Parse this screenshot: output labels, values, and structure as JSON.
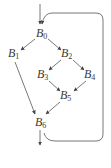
{
  "diagram": {
    "type": "control-flow-graph",
    "stroke_color": "#555555",
    "text_color": "#3a3a3a",
    "nodes": [
      {
        "id": "B0",
        "letter": "B",
        "index": "0",
        "x": 36,
        "y": 27
      },
      {
        "id": "B1",
        "letter": "B",
        "index": "1",
        "x": 8,
        "y": 47
      },
      {
        "id": "B2",
        "letter": "B",
        "index": "2",
        "x": 61,
        "y": 47
      },
      {
        "id": "B3",
        "letter": "B",
        "index": "3",
        "x": 37,
        "y": 68
      },
      {
        "id": "B4",
        "letter": "B",
        "index": "4",
        "x": 84,
        "y": 68
      },
      {
        "id": "B5",
        "letter": "B",
        "index": "5",
        "x": 60,
        "y": 89
      },
      {
        "id": "B6",
        "letter": "B",
        "index": "6",
        "x": 35,
        "y": 116
      }
    ],
    "edges": [
      {
        "from": "entry",
        "to": "B0"
      },
      {
        "from": "B0",
        "to": "B1"
      },
      {
        "from": "B0",
        "to": "B2"
      },
      {
        "from": "B1",
        "to": "B6"
      },
      {
        "from": "B2",
        "to": "B3"
      },
      {
        "from": "B2",
        "to": "B4"
      },
      {
        "from": "B3",
        "to": "B5"
      },
      {
        "from": "B4",
        "to": "B5"
      },
      {
        "from": "B5",
        "to": "B6"
      },
      {
        "from": "B6",
        "to": "B0",
        "kind": "back-edge"
      },
      {
        "from": "B6",
        "to": "exit"
      }
    ]
  }
}
